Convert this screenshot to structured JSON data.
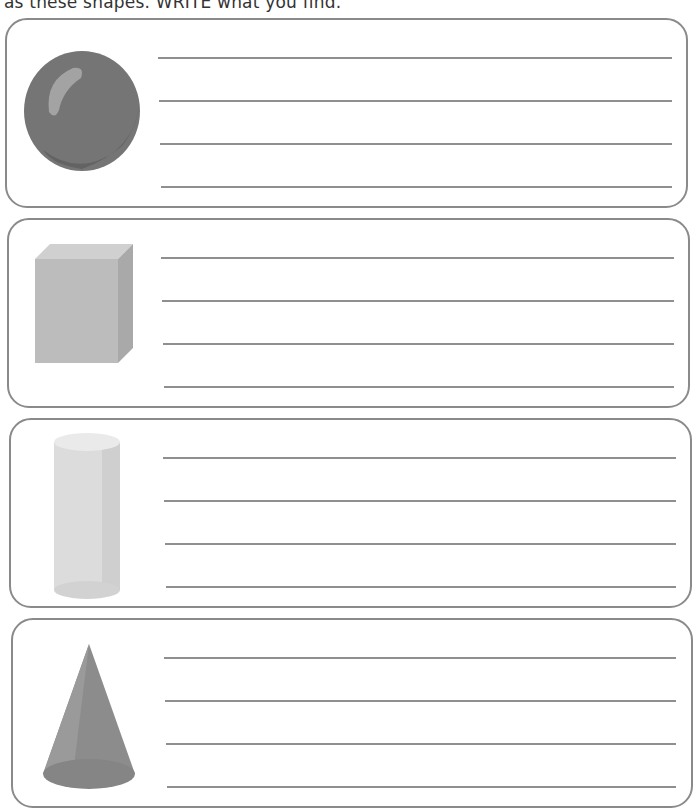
{
  "instruction": "as these shapes. WRITE what you find.",
  "colors": {
    "border": "#8a8a8a",
    "line": "#8f8f8f",
    "sphere": "#777777",
    "cuboid": "#bdbdbd",
    "cylinder": "#dedede",
    "cone": "#8e8e8e"
  },
  "boxes": [
    {
      "shape": "sphere",
      "lines": 4
    },
    {
      "shape": "rectangular-prism",
      "lines": 4
    },
    {
      "shape": "cylinder",
      "lines": 4
    },
    {
      "shape": "cone",
      "lines": 4
    }
  ]
}
